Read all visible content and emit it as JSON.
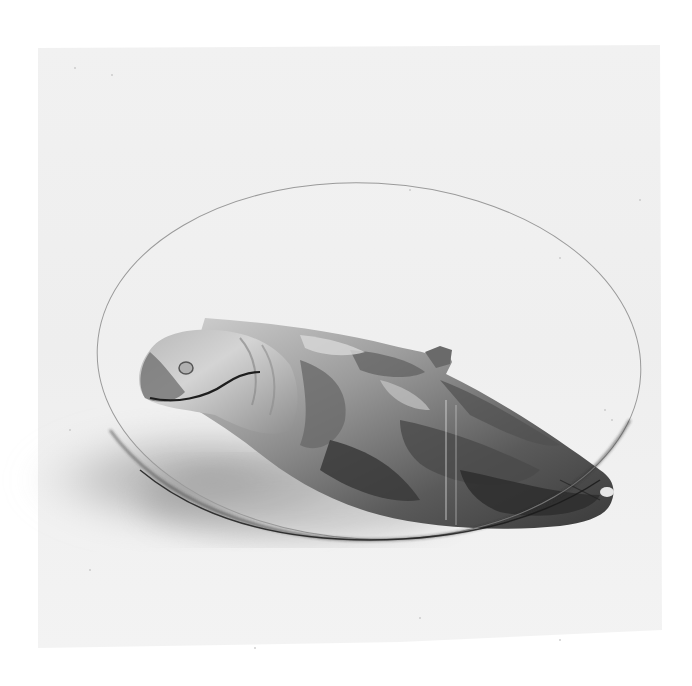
{
  "image": {
    "subject": "Carved wooden seal sculpture supporting an oval glass tabletop",
    "style": "grayscale halftone product photograph",
    "colors": {
      "page": "#ffffff",
      "backdrop": "#f0f0f0",
      "shadow": "#9a9a9a",
      "glass_edge": "#3a3a3a",
      "wood_light": "#c8c8c8",
      "wood_mid": "#8a8a8a",
      "wood_dark": "#3c3c3c"
    }
  }
}
